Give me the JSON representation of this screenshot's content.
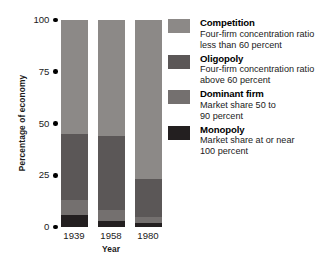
{
  "chart_data": {
    "type": "bar",
    "subtype": "stacked-bar",
    "title": "",
    "xlabel": "Year",
    "ylabel": "Percentage of economy",
    "categories": [
      "1939",
      "1958",
      "1980"
    ],
    "ylim": [
      0,
      100
    ],
    "yticks": [
      0,
      25,
      50,
      75,
      100
    ],
    "ytick_labels": [
      "0",
      "25",
      "50",
      "75",
      "100"
    ],
    "grid": false,
    "legend_position": "right",
    "stack_order_bottom_to_top": [
      "Monopoly",
      "Dominant firm",
      "Oligopoly",
      "Competition"
    ],
    "series": [
      {
        "name": "Monopoly",
        "color": "#231f20",
        "values": [
          6,
          3,
          2
        ]
      },
      {
        "name": "Dominant firm",
        "color": "#74706f",
        "values": [
          7,
          5,
          3
        ]
      },
      {
        "name": "Oligopoly",
        "color": "#5b5757",
        "values": [
          32,
          36,
          18
        ]
      },
      {
        "name": "Competition",
        "color": "#8c8987",
        "values": [
          55,
          56,
          77
        ]
      }
    ]
  },
  "axes": {
    "y_title": "Percentage of economy",
    "x_title": "Year",
    "y_ticks": [
      {
        "label": "100",
        "value": 100
      },
      {
        "label": "75",
        "value": 75
      },
      {
        "label": "50",
        "value": 50
      },
      {
        "label": "25",
        "value": 25
      },
      {
        "label": "0",
        "value": 0
      }
    ],
    "x_ticks": [
      "1939",
      "1958",
      "1980"
    ]
  },
  "bars": [
    {
      "year": "1939",
      "segments": [
        {
          "name": "Competition",
          "value": 55,
          "color": "#8c8987"
        },
        {
          "name": "Oligopoly",
          "value": 32,
          "color": "#5b5757"
        },
        {
          "name": "Dominant firm",
          "value": 7,
          "color": "#74706f"
        },
        {
          "name": "Monopoly",
          "value": 6,
          "color": "#231f20"
        }
      ]
    },
    {
      "year": "1958",
      "segments": [
        {
          "name": "Competition",
          "value": 56,
          "color": "#8c8987"
        },
        {
          "name": "Oligopoly",
          "value": 36,
          "color": "#5b5757"
        },
        {
          "name": "Dominant firm",
          "value": 5,
          "color": "#74706f"
        },
        {
          "name": "Monopoly",
          "value": 3,
          "color": "#231f20"
        }
      ]
    },
    {
      "year": "1980",
      "segments": [
        {
          "name": "Competition",
          "value": 77,
          "color": "#8c8987"
        },
        {
          "name": "Oligopoly",
          "value": 18,
          "color": "#5b5757"
        },
        {
          "name": "Dominant firm",
          "value": 3,
          "color": "#74706f"
        },
        {
          "name": "Monopoly",
          "value": 2,
          "color": "#231f20"
        }
      ]
    }
  ],
  "legend": {
    "items": [
      {
        "title": "Competition",
        "desc_line1": "Four-firm concentration ratio",
        "desc_line2": "less than 60 percent",
        "color": "#8c8987"
      },
      {
        "title": "Oligopoly",
        "desc_line1": "Four-firm concentration ratio",
        "desc_line2": "above 60 percent",
        "color": "#5b5757"
      },
      {
        "title": "Dominant firm",
        "desc_line1": "Market share 50 to",
        "desc_line2": "90 percent",
        "color": "#74706f"
      },
      {
        "title": "Monopoly",
        "desc_line1": "Market share at or near",
        "desc_line2": "100 percent",
        "color": "#231f20"
      }
    ]
  }
}
